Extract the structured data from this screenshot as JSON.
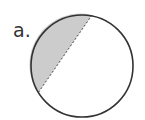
{
  "figure": {
    "label": "a.",
    "circle": {
      "cx": 82,
      "cy": 66,
      "r": 51,
      "stroke": "#333333",
      "fill": "#ffffff"
    },
    "shaded_segment": {
      "fill": "#cccccc",
      "chord_from": [
        92,
        15
      ],
      "chord_to": [
        38,
        93
      ],
      "chord_style": "dashed"
    }
  }
}
